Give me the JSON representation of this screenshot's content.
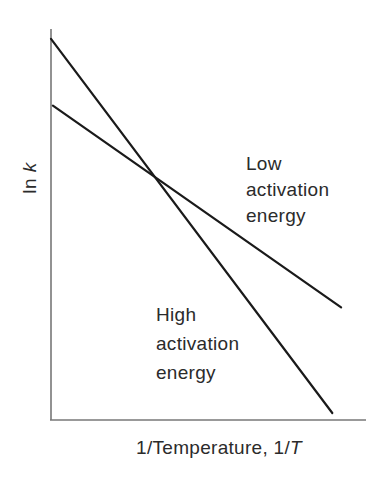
{
  "chart_data": {
    "type": "line",
    "title": "",
    "xlabel": "1/Temperature, 1/T",
    "xlabel_parts": {
      "main": "1/Temperature, 1/",
      "italic": "T"
    },
    "ylabel": "ln k",
    "ylabel_parts": {
      "main": "ln ",
      "italic": "k"
    },
    "grid": false,
    "ticks": false,
    "axis_color": "#777777",
    "line_color": "#1a1a1a",
    "xlim": [
      0,
      1
    ],
    "ylim": [
      0,
      1
    ],
    "series": [
      {
        "name": "High activation energy",
        "label_lines": [
          "High",
          "activation",
          "energy"
        ],
        "x": [
          0.0,
          0.893
        ],
        "y": [
          0.975,
          0.018
        ],
        "note": "steeper slope"
      },
      {
        "name": "Low activation energy",
        "label_lines": [
          "Low",
          "activation",
          "energy"
        ],
        "x": [
          0.006,
          0.921
        ],
        "y": [
          0.804,
          0.288
        ],
        "note": "shallower slope"
      }
    ],
    "annotations": [
      {
        "text": "Lines intersect",
        "x": 0.346,
        "y": 0.615
      }
    ]
  },
  "labels": {
    "low": [
      "Low",
      "activation",
      "energy"
    ],
    "high": [
      "High",
      "activation",
      "energy"
    ]
  }
}
